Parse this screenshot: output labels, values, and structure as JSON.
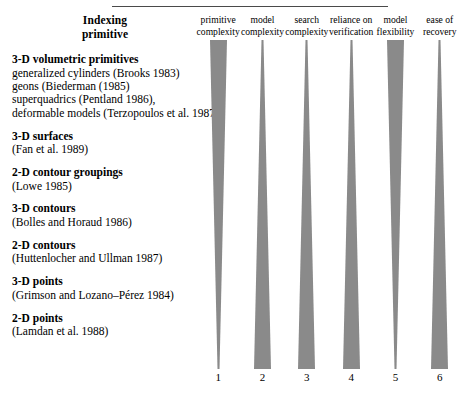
{
  "figure": {
    "left_heading_line1": "Indexing",
    "left_heading_line2": "primitive",
    "bar_color": "#8a8a8a",
    "rule_color": "#4a4a4a"
  },
  "entries": [
    {
      "title": "3-D volumetric primitives",
      "lines": [
        "generalized cylinders (Brooks 1983)",
        "geons (Biederman (1985)",
        "superquadrics (Pentland 1986),",
        "deformable models (Terzopoulos et al. 1987)"
      ]
    },
    {
      "title": "3-D surfaces",
      "lines": [
        "(Fan et al. 1989)"
      ]
    },
    {
      "title": "2-D contour groupings",
      "lines": [
        "(Lowe 1985)"
      ]
    },
    {
      "title": "3-D contours",
      "lines": [
        "(Bolles and Horaud 1986)"
      ]
    },
    {
      "title": "2-D contours",
      "lines": [
        "(Huttenlocher and Ullman 1987)"
      ]
    },
    {
      "title": "3-D points",
      "lines": [
        "(Grimson and Lozano–Pérez 1984)"
      ]
    },
    {
      "title": "2-D points",
      "lines": [
        "(Lamdan et al. 1988)"
      ]
    }
  ],
  "chart_data": {
    "type": "bar",
    "title": "",
    "xlabel": "",
    "ylabel": "",
    "orientation": "vertical-taper",
    "note": "Each column is a triangular wedge. Columns tapering narrow-at-bottom indicate the attribute decreases down the indexing-primitive hierarchy; columns tapering narrow-at-top indicate it increases.",
    "categories": [
      "1",
      "2",
      "3",
      "4",
      "5",
      "6"
    ],
    "columns": [
      {
        "number": "1",
        "header_line1": "primitive",
        "header_line2": "complexity",
        "taper": "down",
        "top_width": 17,
        "bottom_width": 2
      },
      {
        "number": "2",
        "header_line1": "model",
        "header_line2": "complexity",
        "taper": "up",
        "top_width": 2,
        "bottom_width": 17
      },
      {
        "number": "3",
        "header_line1": "search",
        "header_line2": "complexity",
        "taper": "up",
        "top_width": 2,
        "bottom_width": 17
      },
      {
        "number": "4",
        "header_line1": "reliance on",
        "header_line2": "verification",
        "taper": "up",
        "top_width": 2,
        "bottom_width": 17
      },
      {
        "number": "5",
        "header_line1": "model",
        "header_line2": "flexibility",
        "taper": "down",
        "top_width": 17,
        "bottom_width": 2
      },
      {
        "number": "6",
        "header_line1": "ease of",
        "header_line2": "recovery",
        "taper": "up",
        "top_width": 2,
        "bottom_width": 17
      }
    ]
  }
}
